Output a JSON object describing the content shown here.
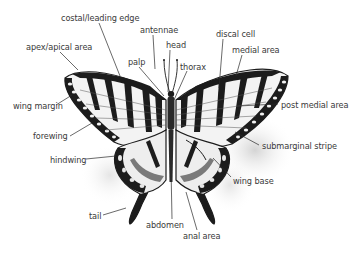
{
  "diagram": {
    "colors": {
      "ink": "#1c1c1c",
      "wing_fill": "#f2f2f2",
      "label_text": "#3a3a3a",
      "leader_line": "#2a2a2a",
      "shadow": "#d9d9d9"
    },
    "labels": [
      {
        "id": "costal",
        "text": "costal/leading edge",
        "x": 61,
        "y": 13
      },
      {
        "id": "antennae",
        "text": "antennae",
        "x": 140,
        "y": 25
      },
      {
        "id": "head",
        "text": "head",
        "x": 166,
        "y": 40
      },
      {
        "id": "discal",
        "text": "discal cell",
        "x": 216,
        "y": 29
      },
      {
        "id": "medial",
        "text": "medial area",
        "x": 232,
        "y": 45
      },
      {
        "id": "apex",
        "text": "apex/apical area",
        "x": 26,
        "y": 42
      },
      {
        "id": "palp",
        "text": "palp",
        "x": 128,
        "y": 57
      },
      {
        "id": "thorax",
        "text": "thorax",
        "x": 180,
        "y": 62
      },
      {
        "id": "wing_margin",
        "text": "wing margin",
        "x": 13,
        "y": 101
      },
      {
        "id": "post_medial",
        "text": "post medial area",
        "x": 281,
        "y": 100
      },
      {
        "id": "forewing",
        "text": "forewing",
        "x": 33,
        "y": 134
      },
      {
        "id": "submarginal",
        "text": "submarginal stripe",
        "x": 262,
        "y": 142
      },
      {
        "id": "hindwing",
        "text": "hindwing",
        "x": 50,
        "y": 156
      },
      {
        "id": "wing_base",
        "text": "wing base",
        "x": 233,
        "y": 177
      },
      {
        "id": "tail",
        "text": "tail",
        "x": 89,
        "y": 213
      },
      {
        "id": "abdomen",
        "text": "abdomen",
        "x": 146,
        "y": 221
      },
      {
        "id": "anal",
        "text": "anal area",
        "x": 183,
        "y": 232
      }
    ]
  }
}
